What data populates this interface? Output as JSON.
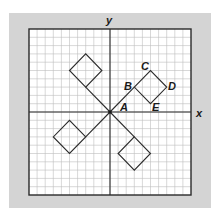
{
  "diagram": {
    "type": "coordinate-grid",
    "axes": {
      "x_label": "x",
      "y_label": "y"
    },
    "grid": {
      "cells_x": 20,
      "cells_y": 20,
      "origin_cell": [
        10,
        10
      ]
    },
    "colors": {
      "background": "#d4d4d4",
      "grid_line": "#b8b8b8",
      "stroke": "#2a2a2a",
      "plot_area": "#ffffff"
    },
    "points": {
      "A": {
        "label": "A",
        "coord": [
          0,
          0
        ]
      },
      "B": {
        "label": "B",
        "coord": [
          3,
          3
        ]
      },
      "C": {
        "label": "C",
        "coord": [
          5,
          5
        ]
      },
      "D": {
        "label": "D",
        "coord": [
          7,
          3
        ]
      },
      "E": {
        "label": "E",
        "coord": [
          5,
          1
        ]
      }
    },
    "shapes": [
      {
        "name": "quadrant-1-square",
        "stem": [
          [
            0,
            0
          ],
          [
            3,
            3
          ]
        ],
        "square": [
          [
            3,
            3
          ],
          [
            5,
            5
          ],
          [
            7,
            3
          ],
          [
            5,
            1
          ]
        ]
      },
      {
        "name": "quadrant-2-square",
        "stem": [
          [
            0,
            0
          ],
          [
            -3,
            3
          ]
        ],
        "square": [
          [
            -3,
            3
          ],
          [
            -5,
            5
          ],
          [
            -3,
            7
          ],
          [
            -1,
            5
          ]
        ]
      },
      {
        "name": "quadrant-3-square",
        "stem": [
          [
            0,
            0
          ],
          [
            -3,
            -3
          ]
        ],
        "square": [
          [
            -3,
            -3
          ],
          [
            -5,
            -1
          ],
          [
            -7,
            -3
          ],
          [
            -5,
            -5
          ]
        ]
      },
      {
        "name": "quadrant-4-square",
        "stem": [
          [
            0,
            0
          ],
          [
            3,
            -3
          ]
        ],
        "square": [
          [
            3,
            -3
          ],
          [
            5,
            -5
          ],
          [
            3,
            -7
          ],
          [
            1,
            -5
          ]
        ]
      }
    ]
  }
}
